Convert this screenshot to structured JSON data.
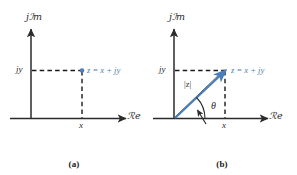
{
  "figure": {
    "title_visible": false,
    "background": "#ffffff",
    "accent_blue": "#4a7ebb",
    "axis_color": "#2b2b2b",
    "dashed_color": "#1a1a1a",
    "magnitude_label_color": "#3a3430"
  },
  "panels": [
    {
      "id": "a",
      "caption": "(a)",
      "axis_labels": {
        "imaginary": "jℐm",
        "imaginary_plain": "jIm",
        "real": "ℛe",
        "real_plain": "Re"
      },
      "ticks": {
        "imaginary": "jy",
        "real": "x"
      },
      "point_label": "z = x + jy",
      "elements": [
        "imaginary-axis",
        "real-axis",
        "horizontal-dashed-line",
        "vertical-dashed-line",
        "point-marker",
        "point-label"
      ]
    },
    {
      "id": "b",
      "caption": "(b)",
      "axis_labels": {
        "imaginary": "jℐm",
        "imaginary_plain": "jIm",
        "real": "ℛe",
        "real_plain": "Re"
      },
      "ticks": {
        "imaginary": "jy",
        "real": "x"
      },
      "point_label": "z = x + jy",
      "magnitude_label": "|z|",
      "angle_label": "θ",
      "elements": [
        "imaginary-axis",
        "real-axis",
        "horizontal-dashed-line",
        "vertical-dashed-line",
        "vector-arrow",
        "magnitude-leader",
        "magnitude-label",
        "angle-arc",
        "angle-arrow",
        "angle-label",
        "point-label"
      ]
    }
  ]
}
